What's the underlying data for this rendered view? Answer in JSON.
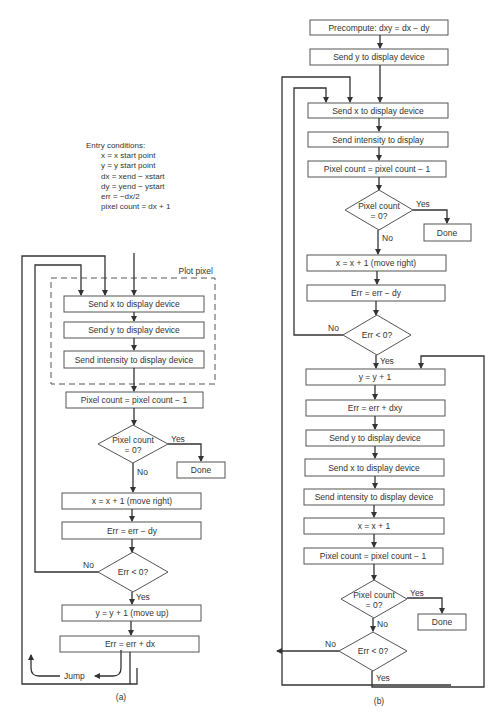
{
  "entry_conditions": {
    "title": "Entry conditions:",
    "lines": [
      "x = x start point",
      "y = y start point",
      "dx = xend − xstart",
      "dy = yend − ystart",
      "err = −dx/2",
      "pixel count = dx + 1"
    ]
  },
  "flow_a": {
    "group_label": "Plot pixel",
    "send_x": "Send x to display device",
    "send_y": "Send y to display device",
    "send_intensity": "Send intensity to display device",
    "pixel_dec": "Pixel count = pixel count − 1",
    "decision_pixel_l1": "Pixel count",
    "decision_pixel_l2": "= 0?",
    "yes": "Yes",
    "no": "No",
    "done": "Done",
    "move_right": "x = x + 1 (move right)",
    "err_minus": "Err = err − dy",
    "decision_err": "Err < 0?",
    "move_up": "y = y + 1 (move up)",
    "err_plus": "Err = err + dx",
    "jump": "Jump",
    "caption": "(a)"
  },
  "flow_b": {
    "precompute": "Precompute:  dxy = dx − dy",
    "send_y": "Send y to display device",
    "send_x": "Send x to display device",
    "send_intensity": "Send intensity to display",
    "pixel_dec": "Pixel count = pixel count − 1",
    "decision_pixel_l1": "Pixel count",
    "decision_pixel_l2": "= 0?",
    "yes": "Yes",
    "no": "No",
    "done": "Done",
    "move_right": "x = x + 1 (move right)",
    "err_minus": "Err = err − dy",
    "decision_err": "Err < 0?",
    "inc_y": "y = y + 1",
    "err_plus": "Err = err + dxy",
    "send_y2": "Send y to display device",
    "send_x2": "Send x to display device",
    "send_intensity2": "Send intensity to display device",
    "inc_x": "x = x + 1",
    "pixel_dec2": "Pixel count = pixel count − 1",
    "decision_pixel2_l1": "Pixel count",
    "decision_pixel2_l2": "= 0?",
    "yes2": "Yes",
    "no2": "No",
    "done2": "Done",
    "decision_err2": "Err < 0?",
    "no3": "No",
    "yes3": "Yes",
    "caption": "(b)"
  }
}
